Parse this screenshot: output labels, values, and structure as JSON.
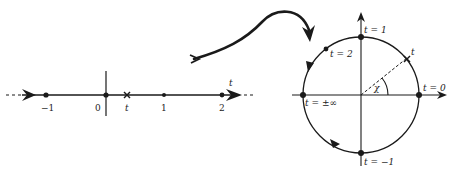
{
  "diagram": {
    "colors": {
      "ink": "#1a1a1a",
      "background": "#ffffff"
    },
    "number_line": {
      "ticks": [
        {
          "label": "−1",
          "value": -1,
          "x": 46
        },
        {
          "label": "0",
          "value": 0,
          "x": 106
        },
        {
          "label": "1",
          "value": 1,
          "x": 164
        },
        {
          "label": "2",
          "value": 2,
          "x": 222
        }
      ],
      "variable_point": {
        "label": "t",
        "x": 127,
        "marker": "cross"
      },
      "axis_label": "t"
    },
    "mapping_arrow": {
      "direction": "left-to-right",
      "style": "curved"
    },
    "circle": {
      "points": [
        {
          "label": "t = 1",
          "position": "top"
        },
        {
          "label": "t = 2",
          "position": "upper-left"
        },
        {
          "label": "t = ±∞",
          "position": "left"
        },
        {
          "label": "t = 0",
          "position": "right"
        },
        {
          "label": "t = −1",
          "position": "bottom"
        },
        {
          "label": "t",
          "position": "upper-right"
        }
      ],
      "angle_label": "χ",
      "orientation": "counterclockwise arrows on arc"
    }
  }
}
